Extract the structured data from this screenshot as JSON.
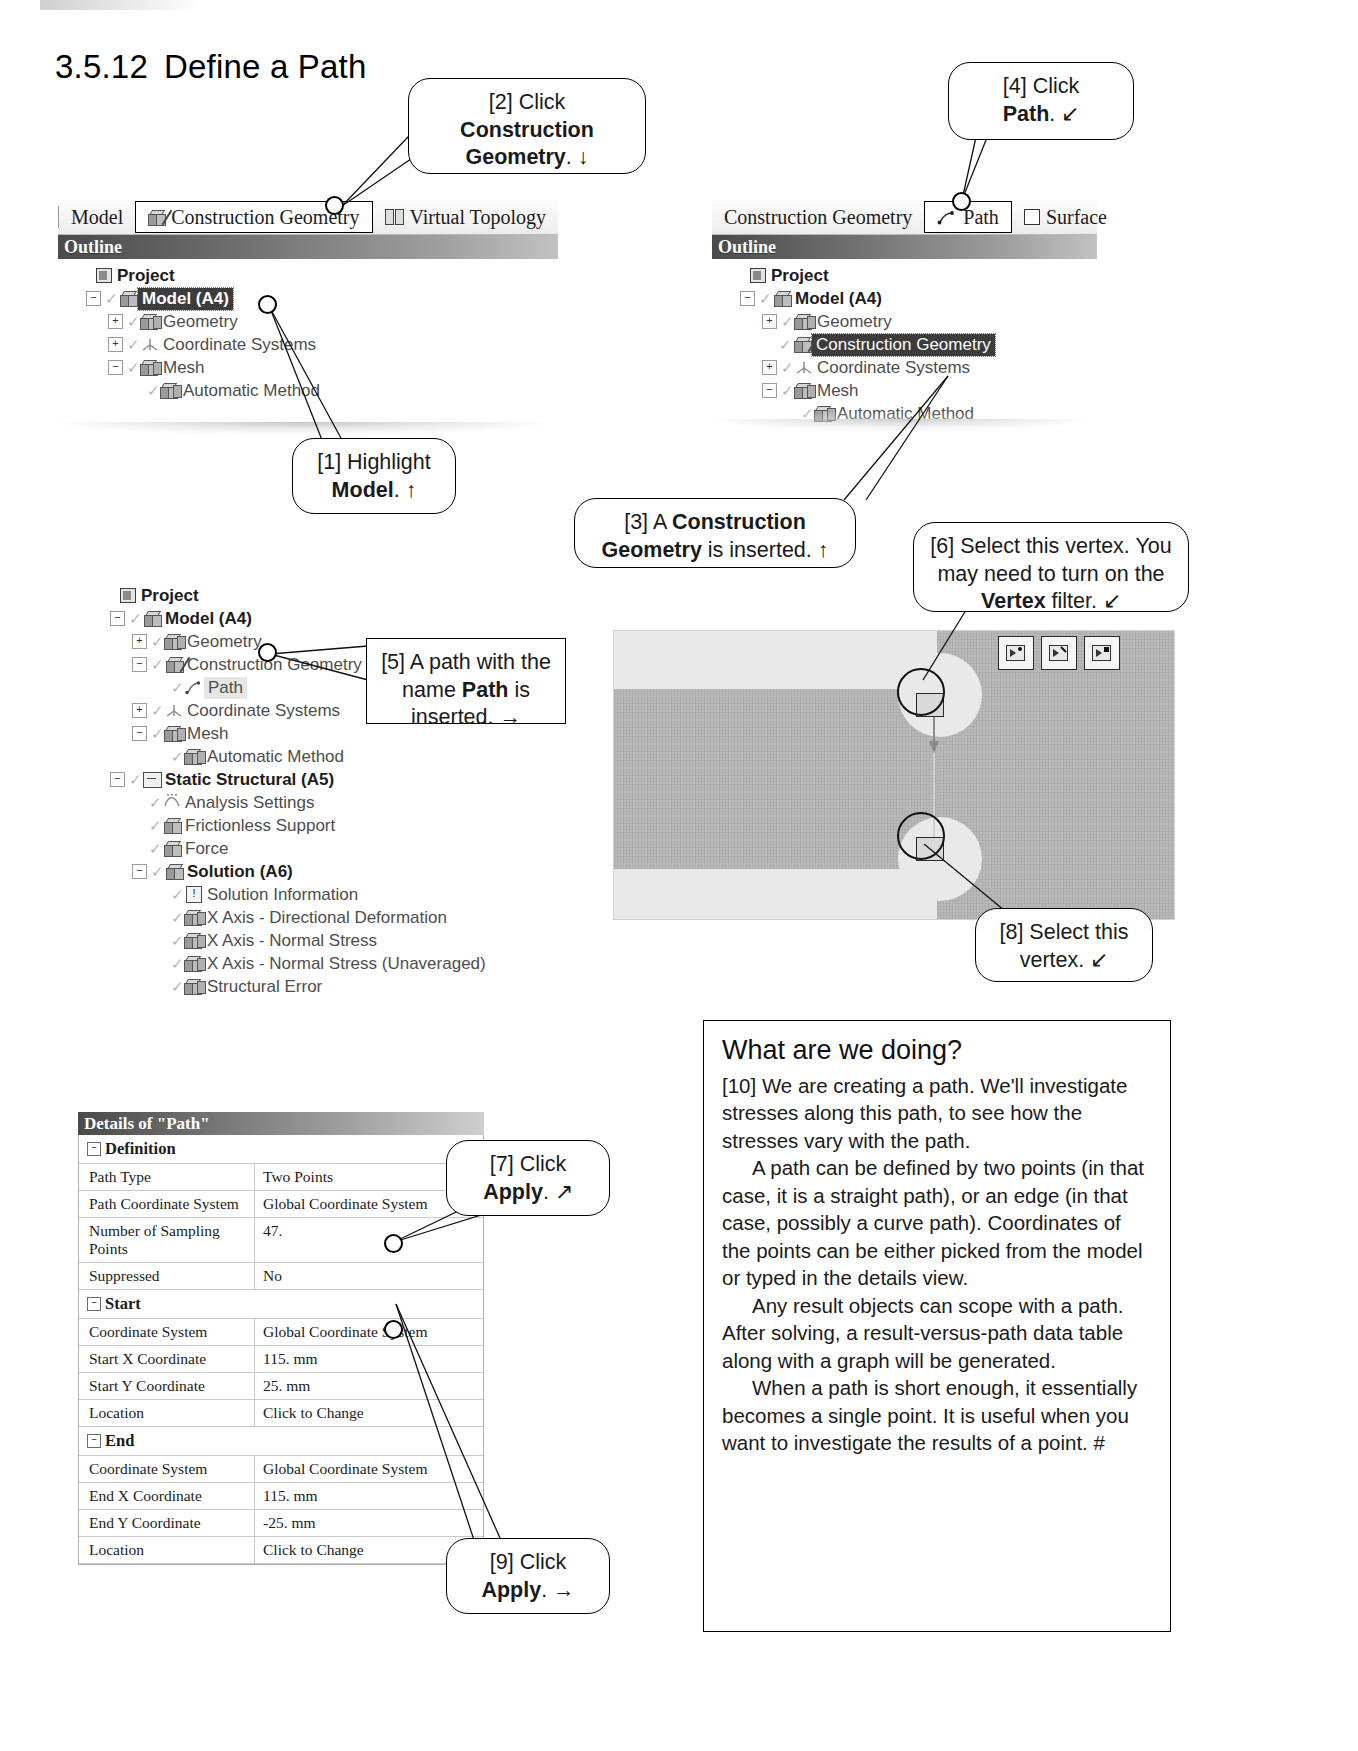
{
  "page": {
    "section_number": "3.5.12",
    "section_title": "Define a Path"
  },
  "callouts": [
    {
      "id": "c1",
      "text_lines": [
        "[1] Highlight",
        "Model. ↑"
      ]
    },
    {
      "id": "c2",
      "text_lines": [
        "[2] Click",
        "Construction",
        "Geometry. ↓"
      ]
    },
    {
      "id": "c3",
      "text_lines": [
        "[3] A Construction",
        "Geometry is inserted. ↑"
      ]
    },
    {
      "id": "c4",
      "text_lines": [
        "[4] Click",
        "Path. ↙"
      ]
    },
    {
      "id": "c5",
      "text_lines": [
        "[5] A path with the",
        "name Path is",
        "inserted. →"
      ]
    },
    {
      "id": "c6",
      "text_lines": [
        "[6] Select this vertex. You",
        "may need to turn on the",
        "Vertex filter. ↙"
      ]
    },
    {
      "id": "c7",
      "text_lines": [
        "[7] Click",
        "Apply. ↗"
      ]
    },
    {
      "id": "c8",
      "text_lines": [
        "[8] Select this",
        "vertex. ↙"
      ]
    },
    {
      "id": "c9",
      "text_lines": [
        "[9] Click",
        "Apply. →"
      ]
    }
  ],
  "callout1": {
    "line1": "[1] Highlight",
    "line2_bold": "Model",
    "line2_rest": ". ↑"
  },
  "callout2": {
    "line1": "[2] Click",
    "line2_bold": "Construction",
    "line3_bold": "Geometry",
    "line3_rest": ". ↓"
  },
  "callout3": {
    "pre": "[3] A ",
    "bold": "Construction",
    "bold2": "Geometry",
    "post": " is inserted. ↑"
  },
  "callout4": {
    "line1": "[4] Click",
    "bold": "Path",
    "post": ". ↙"
  },
  "callout5": {
    "line1": "[5] A path with the",
    "line2pre": "name ",
    "line2bold": "Path",
    "line2post": " is",
    "line3": "inserted. →"
  },
  "callout6": {
    "line1": "[6] Select this vertex. You",
    "line2": "may need to turn on the",
    "line3bold": "Vertex",
    "line3post": " filter. ↙"
  },
  "callout7": {
    "line1": "[7] Click",
    "bold": "Apply",
    "post": ". ↗"
  },
  "callout8": {
    "line1": "[8] Select this",
    "line2": "vertex. ↙"
  },
  "callout9": {
    "line1": "[9] Click",
    "bold": "Apply",
    "post": ". →"
  },
  "panel_a": {
    "tabs": [
      {
        "label": "Model",
        "icon": "none",
        "boxed": false
      },
      {
        "label": "Construction Geometry",
        "icon": "cube-slash-icon",
        "boxed": true
      },
      {
        "label": "Virtual Topology",
        "icon": "virtual-topology-icon",
        "boxed": false
      }
    ],
    "outline_label": "Outline",
    "tree": [
      {
        "label": "Project",
        "depth": 0,
        "expander": "",
        "icon": "project-icon",
        "bold": true,
        "state": "normal"
      },
      {
        "label": "Model (A4)",
        "depth": 1,
        "expander": "−",
        "icon": "cube-icon",
        "bold": true,
        "state": "selected"
      },
      {
        "label": "Geometry",
        "depth": 2,
        "expander": "+",
        "icon": "geometry-icon",
        "bold": false,
        "state": "normal"
      },
      {
        "label": "Coordinate Systems",
        "depth": 2,
        "expander": "+",
        "icon": "coordinate-systems-icon",
        "bold": false,
        "state": "normal"
      },
      {
        "label": "Mesh",
        "depth": 2,
        "expander": "−",
        "icon": "mesh-icon",
        "bold": false,
        "state": "normal"
      },
      {
        "label": "Automatic Method",
        "depth": 3,
        "expander": "",
        "icon": "mesh-icon",
        "bold": false,
        "state": "normal"
      }
    ]
  },
  "panel_b": {
    "tabs": [
      {
        "label": "Construction Geometry",
        "icon": "none",
        "boxed": false
      },
      {
        "label": "Path",
        "icon": "path-icon",
        "boxed": true
      },
      {
        "label": "Surface",
        "icon": "surface-icon",
        "boxed": false
      }
    ],
    "outline_label": "Outline",
    "tree": [
      {
        "label": "Project",
        "depth": 0,
        "expander": "",
        "icon": "project-icon",
        "bold": true,
        "state": "normal"
      },
      {
        "label": "Model (A4)",
        "depth": 1,
        "expander": "−",
        "icon": "cube-icon",
        "bold": true,
        "state": "normal"
      },
      {
        "label": "Geometry",
        "depth": 2,
        "expander": "+",
        "icon": "geometry-icon",
        "bold": false,
        "state": "normal"
      },
      {
        "label": "Construction Geometry",
        "depth": 2,
        "expander": "",
        "icon": "cube-slash-icon",
        "bold": false,
        "state": "selected"
      },
      {
        "label": "Coordinate Systems",
        "depth": 2,
        "expander": "+",
        "icon": "coordinate-systems-icon",
        "bold": false,
        "state": "normal"
      },
      {
        "label": "Mesh",
        "depth": 2,
        "expander": "−",
        "icon": "mesh-icon",
        "bold": false,
        "state": "normal"
      },
      {
        "label": "Automatic Method",
        "depth": 3,
        "expander": "",
        "icon": "mesh-icon",
        "bold": false,
        "state": "normal"
      }
    ]
  },
  "panel_c": {
    "tree": [
      {
        "label": "Project",
        "depth": 0,
        "expander": "",
        "icon": "project-icon",
        "bold": true,
        "state": "normal"
      },
      {
        "label": "Model (A4)",
        "depth": 1,
        "expander": "−",
        "icon": "cube-icon",
        "bold": true,
        "state": "normal"
      },
      {
        "label": "Geometry",
        "depth": 2,
        "expander": "+",
        "icon": "geometry-icon",
        "bold": false,
        "state": "normal"
      },
      {
        "label": "Construction Geometry",
        "depth": 2,
        "expander": "−",
        "icon": "cube-slash-icon",
        "bold": false,
        "state": "normal"
      },
      {
        "label": "Path",
        "depth": 3,
        "expander": "",
        "icon": "path-icon",
        "bold": false,
        "state": "lite"
      },
      {
        "label": "Coordinate Systems",
        "depth": 2,
        "expander": "+",
        "icon": "coordinate-systems-icon",
        "bold": false,
        "state": "normal"
      },
      {
        "label": "Mesh",
        "depth": 2,
        "expander": "−",
        "icon": "mesh-icon",
        "bold": false,
        "state": "normal"
      },
      {
        "label": "Automatic Method",
        "depth": 3,
        "expander": "",
        "icon": "mesh-icon",
        "bold": false,
        "state": "normal"
      },
      {
        "label": "Static Structural (A5)",
        "depth": 1,
        "expander": "−",
        "icon": "folder-icon",
        "bold": true,
        "state": "normal"
      },
      {
        "label": "Analysis Settings",
        "depth": 2,
        "expander": "",
        "icon": "analysis-settings-icon",
        "bold": false,
        "state": "normal"
      },
      {
        "label": "Frictionless Support",
        "depth": 2,
        "expander": "",
        "icon": "support-icon",
        "bold": false,
        "state": "normal"
      },
      {
        "label": "Force",
        "depth": 2,
        "expander": "",
        "icon": "force-icon",
        "bold": false,
        "state": "normal"
      },
      {
        "label": "Solution (A6)",
        "depth": 2,
        "expander": "−",
        "icon": "cube-icon",
        "bold": true,
        "state": "normal"
      },
      {
        "label": "Solution Information",
        "depth": 3,
        "expander": "",
        "icon": "solution-information-icon",
        "bold": false,
        "state": "normal"
      },
      {
        "label": "X Axis - Directional Deformation",
        "depth": 3,
        "expander": "",
        "icon": "result-icon",
        "bold": false,
        "state": "normal"
      },
      {
        "label": "X Axis - Normal Stress",
        "depth": 3,
        "expander": "",
        "icon": "result-icon",
        "bold": false,
        "state": "normal"
      },
      {
        "label": "X Axis - Normal Stress (Unaveraged)",
        "depth": 3,
        "expander": "",
        "icon": "result-icon",
        "bold": false,
        "state": "normal"
      },
      {
        "label": "Structural Error",
        "depth": 3,
        "expander": "",
        "icon": "result-icon",
        "bold": false,
        "state": "normal"
      }
    ]
  },
  "details": {
    "title": "Details of \"Path\"",
    "rows": [
      {
        "type": "group",
        "key": "Definition",
        "value": ""
      },
      {
        "type": "item",
        "key": "Path Type",
        "value": "Two Points"
      },
      {
        "type": "item",
        "key": "Path Coordinate System",
        "value": "Global Coordinate System"
      },
      {
        "type": "item",
        "key": "Number of Sampling Points",
        "value": "47."
      },
      {
        "type": "item",
        "key": "Suppressed",
        "value": "No"
      },
      {
        "type": "group",
        "key": "Start",
        "value": ""
      },
      {
        "type": "item",
        "key": "Coordinate System",
        "value": "Global Coordinate System"
      },
      {
        "type": "item",
        "key": "Start X Coordinate",
        "value": "115. mm"
      },
      {
        "type": "item",
        "key": "Start Y Coordinate",
        "value": "25. mm"
      },
      {
        "type": "item",
        "key": "Location",
        "value": "Click to Change"
      },
      {
        "type": "group",
        "key": "End",
        "value": ""
      },
      {
        "type": "item",
        "key": "Coordinate System",
        "value": "Global Coordinate System"
      },
      {
        "type": "item",
        "key": "End X Coordinate",
        "value": "115. mm"
      },
      {
        "type": "item",
        "key": "End Y Coordinate",
        "value": "-25. mm"
      },
      {
        "type": "item",
        "key": "Location",
        "value": "Click to Change"
      }
    ]
  },
  "viewport": {
    "filter_buttons": [
      {
        "name": "vertex-filter-button"
      },
      {
        "name": "edge-filter-button"
      },
      {
        "name": "face-filter-button"
      }
    ]
  },
  "infobox": {
    "heading": "What are we doing?",
    "p1": "[10] We are creating a path. We'll investigate stresses along this path, to see how the stresses vary with the path.",
    "p2": "A path can be defined by two points (in that case, it is a straight path), or an edge (in that case, possibly a curve path).  Coordinates of the points can be either picked from the model or typed in the details view.",
    "p3": "Any result objects can scope with a path. After solving, a result-versus-path data table along with a graph will be generated.",
    "p4": "When a path is short enough, it essentially becomes a single point.  It is useful when you want to investigate the results of a point. #"
  }
}
